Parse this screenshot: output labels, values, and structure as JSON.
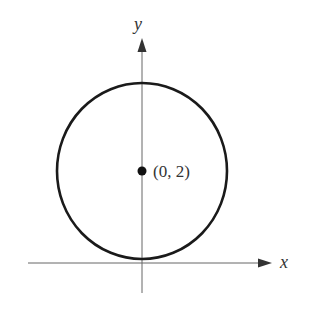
{
  "figure": {
    "x_axis_label": "x",
    "y_axis_label": "y",
    "center_point_label": "(0, 2)",
    "shape": "circle",
    "center": [
      0,
      2
    ],
    "radius": 2,
    "colors": {
      "axis": "#555555",
      "circle": "#1a1a1a",
      "point": "#111111",
      "text": "#333333"
    }
  }
}
